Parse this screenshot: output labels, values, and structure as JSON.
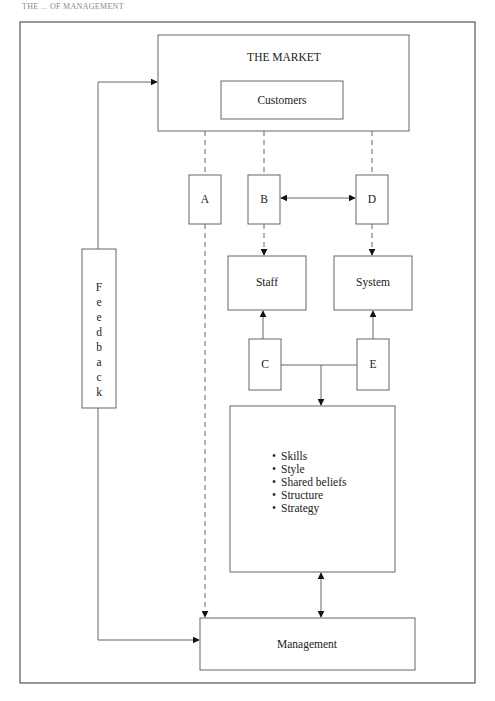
{
  "page_header": "THE ... OF MANAGEMENT",
  "diagram": {
    "market": {
      "title": "THE MARKET",
      "inner": "Customers"
    },
    "nodes": {
      "A": "A",
      "B": "B",
      "C": "C",
      "D": "D",
      "E": "E",
      "staff": "Staff",
      "system": "System",
      "management": "Management",
      "feedback": [
        "F",
        "e",
        "e",
        "d",
        "b",
        "a",
        "c",
        "k"
      ]
    },
    "core_box_items": [
      "Skills",
      "Style",
      "Shared beliefs",
      "Structure",
      "Strategy"
    ],
    "edges": [
      {
        "from": "Customers",
        "to": "A",
        "style": "dashed"
      },
      {
        "from": "Customers",
        "to": "B",
        "style": "dashed"
      },
      {
        "from": "Customers",
        "to": "D",
        "style": "dashed"
      },
      {
        "from": "A",
        "to": "Management",
        "style": "dashed-arrow"
      },
      {
        "from": "B",
        "to": "Staff",
        "style": "dashed-arrow"
      },
      {
        "from": "D",
        "to": "System",
        "style": "dashed-arrow"
      },
      {
        "from": "B",
        "to": "D",
        "style": "double-arrow"
      },
      {
        "from": "C",
        "to": "Staff",
        "style": "arrow"
      },
      {
        "from": "E",
        "to": "System",
        "style": "arrow"
      },
      {
        "from": "C-E junction",
        "to": "Core box",
        "style": "arrow"
      },
      {
        "from": "Core box",
        "to": "Management",
        "style": "double-arrow"
      },
      {
        "from": "Feedback",
        "to": "THE MARKET",
        "style": "arrow"
      },
      {
        "from": "Feedback",
        "to": "Management",
        "style": "arrow"
      }
    ],
    "colors": {
      "line": "#555555",
      "arrowhead": "#111111",
      "background": "#ffffff"
    }
  }
}
